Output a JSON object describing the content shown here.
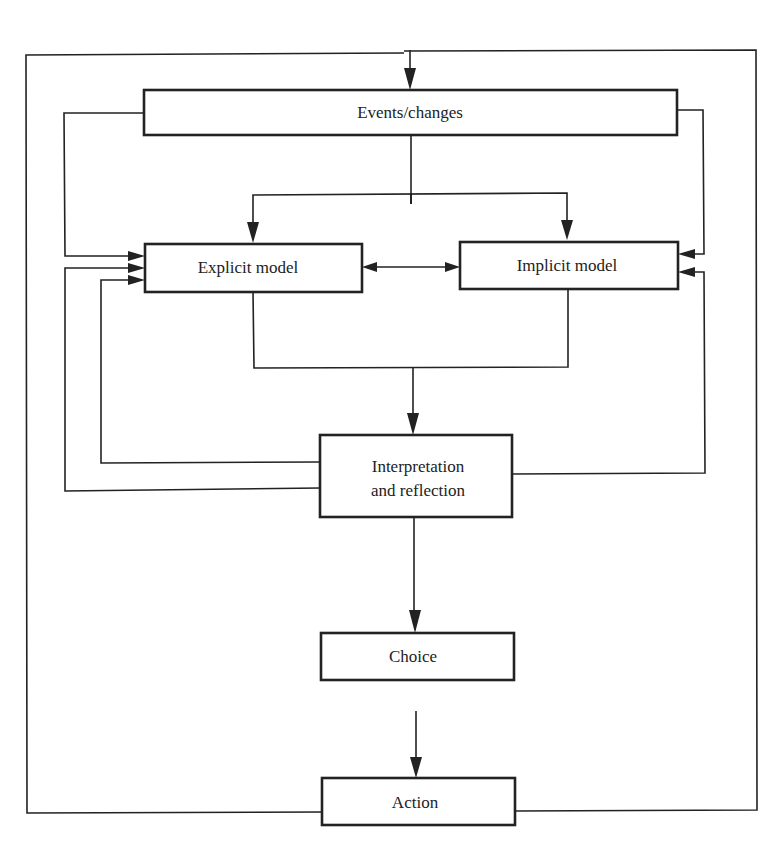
{
  "diagram": {
    "colors": {
      "stroke": "#222222",
      "background": "#ffffff"
    },
    "nodes": {
      "events": {
        "label": "Events/changes"
      },
      "explicit": {
        "label": "Explicit model"
      },
      "implicit": {
        "label": "Implicit model"
      },
      "interpretation": {
        "line1": "Interpretation",
        "line2": "and reflection"
      },
      "choice": {
        "label": "Choice"
      },
      "action": {
        "label": "Action"
      }
    },
    "edges": [
      {
        "from": "action",
        "to": "events",
        "type": "outer feedback loop"
      },
      {
        "from": "events",
        "to": "explicit"
      },
      {
        "from": "events",
        "to": "implicit"
      },
      {
        "from": "explicit",
        "to": "implicit",
        "bidirectional": true
      },
      {
        "from": "explicit",
        "to": "interpretation",
        "merged_with": "implicit"
      },
      {
        "from": "interpretation",
        "to": "explicit",
        "count": 2
      },
      {
        "from": "interpretation",
        "to": "implicit"
      },
      {
        "from": "events",
        "to": "explicit",
        "type": "side feed"
      },
      {
        "from": "events",
        "to": "implicit",
        "type": "side feed"
      },
      {
        "from": "interpretation",
        "to": "choice"
      },
      {
        "from": "choice",
        "to": "action"
      }
    ]
  }
}
